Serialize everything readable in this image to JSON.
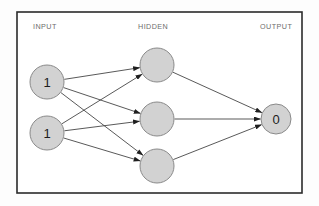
{
  "diagram": {
    "canvas": {
      "width": 319,
      "height": 206
    },
    "frame": {
      "x": 17,
      "y": 12,
      "width": 285,
      "height": 181,
      "border_color": "#2b2b2b",
      "background_color": "#ffffff"
    },
    "palette": {
      "node_fill": "#d2d2d2",
      "node_stroke": "#8a8a8a",
      "edge_color": "#3b3b3b",
      "label_color": "#6d6d6d",
      "value_color": "#1d1d1d",
      "page_background": "#fdfdfd"
    },
    "labels": [
      {
        "id": "input-label",
        "text": "INPUT",
        "x": 33,
        "y": 29
      },
      {
        "id": "hidden-label",
        "text": "HIDDEN",
        "x": 138,
        "y": 29
      },
      {
        "id": "output-label",
        "text": "OUTPUT",
        "x": 260,
        "y": 29
      }
    ],
    "layers": [
      {
        "name": "input",
        "label": "INPUT",
        "node_count": 2,
        "nodes": [
          {
            "id": "input-node-1",
            "value": "1",
            "cx": 47,
            "cy": 82,
            "r": 17
          },
          {
            "id": "input-node-2",
            "value": "1",
            "cx": 47,
            "cy": 133,
            "r": 17
          }
        ]
      },
      {
        "name": "hidden",
        "label": "HIDDEN",
        "node_count": 3,
        "nodes": [
          {
            "id": "hidden-node-1",
            "value": "",
            "cx": 157,
            "cy": 65,
            "r": 17
          },
          {
            "id": "hidden-node-2",
            "value": "",
            "cx": 157,
            "cy": 119,
            "r": 17
          },
          {
            "id": "hidden-node-3",
            "value": "",
            "cx": 157,
            "cy": 166,
            "r": 17
          }
        ]
      },
      {
        "name": "output",
        "label": "OUTPUT",
        "node_count": 1,
        "nodes": [
          {
            "id": "output-node-1",
            "value": "0",
            "cx": 276,
            "cy": 119,
            "r": 15
          }
        ]
      }
    ],
    "edges": [
      {
        "id": "edge-i1-h1",
        "from": "input-node-1",
        "to": "hidden-node-1"
      },
      {
        "id": "edge-i1-h2",
        "from": "input-node-1",
        "to": "hidden-node-2"
      },
      {
        "id": "edge-i1-h3",
        "from": "input-node-1",
        "to": "hidden-node-3"
      },
      {
        "id": "edge-i2-h1",
        "from": "input-node-2",
        "to": "hidden-node-1"
      },
      {
        "id": "edge-i2-h2",
        "from": "input-node-2",
        "to": "hidden-node-2"
      },
      {
        "id": "edge-i2-h3",
        "from": "input-node-2",
        "to": "hidden-node-3"
      },
      {
        "id": "edge-h1-o1",
        "from": "hidden-node-1",
        "to": "output-node-1"
      },
      {
        "id": "edge-h2-o1",
        "from": "hidden-node-2",
        "to": "output-node-1"
      },
      {
        "id": "edge-h3-o1",
        "from": "hidden-node-3",
        "to": "output-node-1"
      }
    ]
  }
}
